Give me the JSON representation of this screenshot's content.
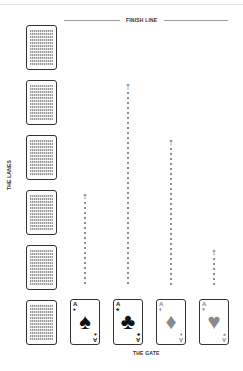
{
  "header": {
    "finish_label": "FINISH LINE"
  },
  "side": {
    "lanes_label": "THE LANES"
  },
  "footer": {
    "gate_label": "THE GATE"
  },
  "lane_cards": [
    {
      "lane": 1,
      "face": "down",
      "top": 25
    },
    {
      "lane": 2,
      "face": "down",
      "top": 80
    },
    {
      "lane": 3,
      "face": "down",
      "top": 135
    },
    {
      "lane": 4,
      "face": "down",
      "top": 190
    },
    {
      "lane": 5,
      "face": "down",
      "top": 245
    },
    {
      "lane": 6,
      "face": "down",
      "top": 300
    }
  ],
  "racers": [
    {
      "rank": "A",
      "suit": "spades",
      "symbol": "♠",
      "color": "#111111",
      "track_top": 194,
      "left": 70
    },
    {
      "rank": "A",
      "suit": "clubs",
      "symbol": "♣",
      "color": "#111111",
      "track_top": 84,
      "left": 113
    },
    {
      "rank": "A",
      "suit": "diamonds",
      "symbol": "♦",
      "color": "#8a8a8a",
      "track_top": 140,
      "left": 156
    },
    {
      "rank": "A",
      "suit": "hearts",
      "symbol": "♥",
      "color": "#8a8a8a",
      "track_top": 250,
      "left": 199
    }
  ],
  "track": {
    "bottom": 285,
    "arrow_symbol": "⇡"
  }
}
